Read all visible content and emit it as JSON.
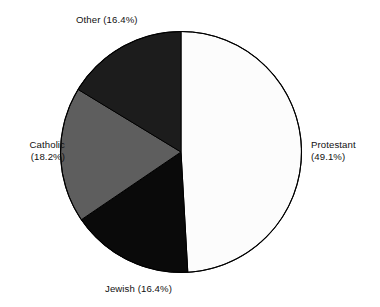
{
  "chart_data": {
    "type": "pie",
    "title": "",
    "subtitle": "",
    "xlabel": "",
    "ylabel": "",
    "legend_position": "none",
    "grid": false,
    "labels_mode": "outside-callout",
    "start_angle_deg": 0,
    "direction": "clockwise",
    "categories": [
      "Protestant",
      "Jewish",
      "Catholic",
      "Other"
    ],
    "values": [
      49.1,
      16.4,
      18.2,
      16.4
    ],
    "value_unit": "%",
    "slices": [
      {
        "name": "Protestant",
        "value": 49.1,
        "value_text": "(49.1%)",
        "label_text": "Protestant",
        "color": "#fcfcfc",
        "start_angle_deg": 0.0,
        "end_angle_deg": 176.76
      },
      {
        "name": "Jewish",
        "value": 16.4,
        "value_text": "(16.4%)",
        "label_text": "Jewish",
        "color": "#0a0a0a",
        "start_angle_deg": 176.76,
        "end_angle_deg": 235.8
      },
      {
        "name": "Catholic",
        "value": 18.2,
        "value_text": "(18.2%)",
        "label_text": "Catholic",
        "color": "#5e5e5e",
        "start_angle_deg": 235.8,
        "end_angle_deg": 301.32
      },
      {
        "name": "Other",
        "value": 16.4,
        "value_text": "(16.4%)",
        "label_text": "Other",
        "color": "#1c1c1c",
        "start_angle_deg": 301.32,
        "end_angle_deg": 360.0
      }
    ]
  },
  "labels": {
    "other": "Other (16.4%)",
    "jewish": "Jewish (16.4%)",
    "protestant_line1": "Protestant",
    "protestant_line2": "(49.1%)",
    "catholic_line1": "Catholic",
    "catholic_line2": "(18.2%)"
  },
  "colors": {
    "background": "#ffffff",
    "outline": "#000000",
    "protestant": "#fcfcfc",
    "jewish": "#0a0a0a",
    "catholic": "#5e5e5e",
    "other": "#1c1c1c",
    "text": "#111111"
  }
}
